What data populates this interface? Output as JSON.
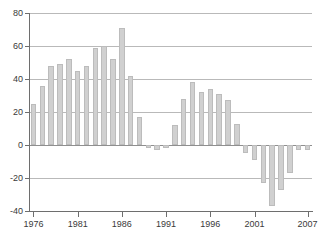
{
  "chart_data": {
    "type": "bar",
    "title": "",
    "subtitle": "",
    "xlabel": "",
    "ylabel": "",
    "categories": [
      1976,
      1977,
      1978,
      1979,
      1980,
      1981,
      1982,
      1983,
      1984,
      1985,
      1986,
      1987,
      1988,
      1989,
      1990,
      1991,
      1992,
      1993,
      1994,
      1995,
      1996,
      1997,
      1998,
      1999,
      2000,
      2001,
      2002,
      2003,
      2004,
      2005,
      2006,
      2007
    ],
    "values": [
      25,
      36,
      48,
      49,
      52,
      45,
      48,
      59,
      60,
      52,
      71,
      42,
      17,
      -2,
      -3,
      -2,
      12,
      28,
      38,
      32,
      34,
      31,
      27,
      13,
      -5,
      -9,
      -23,
      -37,
      -27,
      -17,
      -3,
      -3
    ],
    "series": [
      {
        "name": "",
        "values": [
          25,
          36,
          48,
          49,
          52,
          45,
          48,
          59,
          60,
          52,
          71,
          42,
          17,
          -2,
          -3,
          -2,
          12,
          28,
          38,
          32,
          34,
          31,
          27,
          13,
          -5,
          -9,
          -23,
          -37,
          -27,
          -17,
          -3,
          -3
        ]
      }
    ],
    "ylim": [
      -40,
      80
    ],
    "xlim": [
      1975.5,
      2007.5
    ],
    "yticks": [
      80,
      60,
      40,
      20,
      0,
      -20,
      -40
    ],
    "ytick_labels": [
      "80",
      "60",
      "40",
      "20",
      "0",
      "-20",
      "-40"
    ],
    "xticks": [
      1976,
      1981,
      1986,
      1991,
      1996,
      2001,
      2007
    ],
    "xtick_labels": [
      "1976",
      "1981",
      "1986",
      "1991",
      "1996",
      "2001",
      "2007"
    ],
    "grid": true,
    "grid_axis": "y",
    "legend": false,
    "legend_position": "none",
    "annotations": [],
    "colors": {
      "bar_fill": "#d0d0d0",
      "bar_stroke": "#bcbcbc",
      "gridline": "#b9b9b9",
      "zero_line": "#8f8f8f",
      "axis": "#6e6e6e",
      "tick_text": "#3a3a3a",
      "background": "#ffffff"
    }
  }
}
